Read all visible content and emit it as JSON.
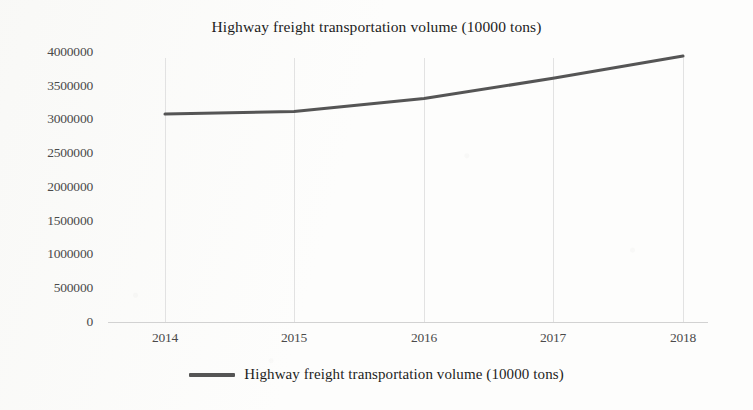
{
  "chart_data": {
    "type": "line",
    "title": "Highway freight transportation volume (10000 tons)",
    "xlabel": "",
    "ylabel": "",
    "categories": [
      "2014",
      "2015",
      "2016",
      "2017",
      "2018"
    ],
    "series": [
      {
        "name": "Highway freight transportation volume (10000 tons)",
        "values": [
          3080000,
          3120000,
          3310000,
          3610000,
          3940000
        ],
        "color": "#555555"
      }
    ],
    "ylim": [
      0,
      4000000
    ],
    "ytick_labels": [
      "4000000",
      "3500000",
      "3000000",
      "2500000",
      "2000000",
      "1500000",
      "1000000",
      "500000",
      "0"
    ],
    "ytick_values": [
      4000000,
      3500000,
      3000000,
      2500000,
      2000000,
      1500000,
      1000000,
      500000,
      0
    ],
    "grid": {
      "vertical": true,
      "horizontal": false
    },
    "legend": {
      "position": "bottom",
      "entries": [
        "Highway freight transportation volume (10000 tons)"
      ]
    }
  }
}
